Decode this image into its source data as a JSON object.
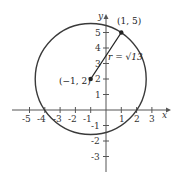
{
  "diagram": {
    "axes": {
      "x_label": "x",
      "y_label": "y",
      "x_ticks": [
        "-5",
        "-4",
        "-3",
        "-2",
        "-1",
        "1",
        "2",
        "3"
      ],
      "y_ticks": [
        "5",
        "4",
        "3",
        "2",
        "1",
        "-1",
        "-2",
        "-3"
      ]
    },
    "center_point": {
      "label": "(−1, 2)",
      "x": -1,
      "y": 2
    },
    "edge_point": {
      "label": "(1, 5)",
      "x": 1,
      "y": 5
    },
    "radius_label": "r = √13",
    "colors": {
      "circle": "#3a3a3a",
      "axes": "#555555",
      "points": "#222222"
    }
  }
}
